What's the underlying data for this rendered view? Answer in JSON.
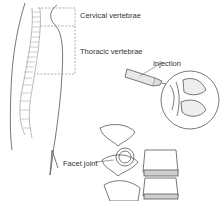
{
  "figure": {
    "type": "medical-illustration",
    "labels": {
      "cervical": "Cervical vertebrae",
      "thoracic": "Thoracic vertebrae",
      "injection": "Injection",
      "facet": "Facet joint"
    },
    "colors": {
      "line": "#555555",
      "shade": "#cfcfcf",
      "text": "#333333"
    }
  }
}
